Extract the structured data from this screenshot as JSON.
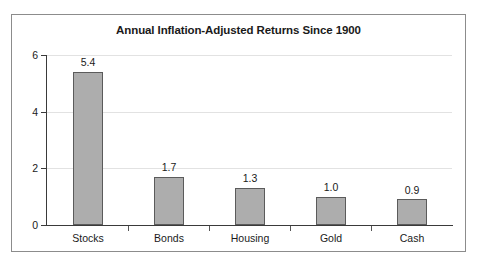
{
  "chart_data": {
    "type": "bar",
    "title": "Annual Inflation-Adjusted Returns Since 1900",
    "categories": [
      "Stocks",
      "Bonds",
      "Housing",
      "Gold",
      "Cash"
    ],
    "values": [
      5.4,
      1.7,
      1.3,
      1.0,
      0.9
    ],
    "value_labels": [
      "5.4",
      "1.7",
      "1.3",
      "1.0",
      "0.9"
    ],
    "xlabel": "",
    "ylabel": "",
    "ylim": [
      0,
      6
    ],
    "yticks": [
      0,
      2,
      4,
      6
    ],
    "ytick_labels": [
      "0",
      "2",
      "4",
      "6"
    ],
    "grid": true,
    "grid_axis": "y",
    "legend": false,
    "legend_position": "none",
    "bar_color": "#adadad",
    "bar_edge_color": "#5b5b5b",
    "grid_color": "#e2e2e2",
    "axis_color": "#3a3a3a",
    "text_color": "#1a1a1a",
    "frame_color": "#8c8c8c"
  }
}
